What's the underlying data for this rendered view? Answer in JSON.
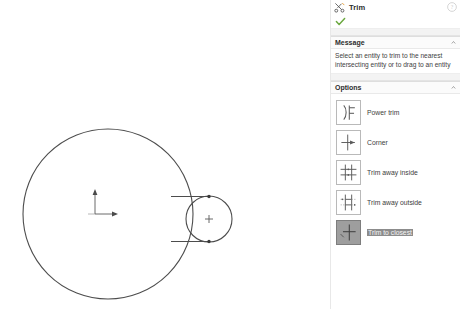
{
  "panel": {
    "title": "Trim",
    "title_icon": "trim-scissors-icon",
    "help_icon": "help-question-icon",
    "confirm_icon": "green-check-icon",
    "message": {
      "heading": "Message",
      "text": "Select an entity to trim to the nearest intersecting entity or to drag to an entity",
      "collapse_icon": "chevron-up-icon"
    },
    "options": {
      "heading": "Options",
      "collapse_icon": "chevron-up-icon",
      "items": [
        {
          "label": "Power trim",
          "icon": "power-trim-icon",
          "selected": false
        },
        {
          "label": "Corner",
          "icon": "corner-trim-icon",
          "selected": false
        },
        {
          "label": "Trim away inside",
          "icon": "trim-away-inside-icon",
          "selected": false
        },
        {
          "label": "Trim away outside",
          "icon": "trim-away-outside-icon",
          "selected": false
        },
        {
          "label": "Trim to closest",
          "icon": "trim-to-closest-icon",
          "selected": true
        }
      ]
    }
  },
  "canvas": {
    "name": "sketch-canvas",
    "background": "#ffffff",
    "line_color": "#4a4a4a",
    "entities": [
      {
        "name": "large-circle",
        "type": "circle",
        "cx": 108,
        "cy": 214,
        "r": 85
      },
      {
        "name": "small-circle",
        "type": "circle",
        "cx": 209,
        "cy": 219,
        "r": 24
      },
      {
        "name": "upper-tangent-line",
        "type": "line",
        "x1": 172,
        "y1": 196,
        "x2": 209,
        "y2": 196
      },
      {
        "name": "lower-tangent-line",
        "type": "line",
        "x1": 172,
        "y1": 241,
        "x2": 209,
        "y2": 241
      },
      {
        "name": "small-circle-center",
        "type": "point-plus",
        "cx": 209,
        "cy": 219
      },
      {
        "name": "origin-marker",
        "type": "axes",
        "x": 95,
        "y": 214
      }
    ]
  }
}
